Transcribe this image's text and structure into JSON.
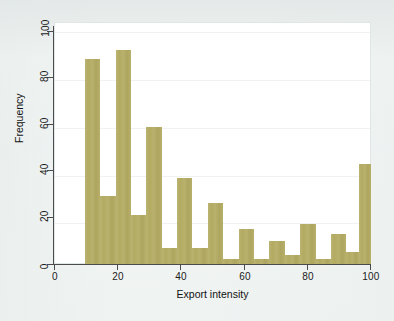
{
  "chart_data": {
    "type": "bar",
    "subtype": "histogram",
    "title": "",
    "xlabel": "Export intensity",
    "ylabel": "Frequency",
    "xlim": [
      0,
      100
    ],
    "ylim": [
      0,
      100
    ],
    "grid": true,
    "legend": null,
    "bar_color": "#b3ab62",
    "plot_background": "#ffffff",
    "page_background": "#edf1f0",
    "bin_width": 5,
    "xticks": [
      0,
      20,
      40,
      60,
      80,
      100
    ],
    "xtick_labels": [
      "0",
      "20",
      "40",
      "60",
      "80",
      "100"
    ],
    "yticks": [
      0,
      20,
      40,
      60,
      80,
      100
    ],
    "ytick_labels": [
      "0",
      "20",
      "40",
      "60",
      "80",
      "100"
    ],
    "bin_starts": [
      10,
      15,
      20,
      25,
      30,
      35,
      40,
      45,
      50,
      55,
      60,
      65,
      70,
      75,
      80,
      85,
      90,
      95
    ],
    "categories": [
      "10-15",
      "15-20",
      "20-25",
      "25-30",
      "30-35",
      "35-40",
      "40-45",
      "45-50",
      "50-55",
      "55-60",
      "60-65",
      "65-70",
      "70-75",
      "75-80",
      "80-85",
      "85-90",
      "90-95",
      "95-100"
    ],
    "values": [
      88,
      29,
      92,
      21,
      59,
      7,
      37,
      7,
      26,
      2,
      15,
      2,
      10,
      4,
      17,
      2,
      13,
      5
    ],
    "extra_bar": {
      "category": "100",
      "value": 43,
      "note": "tall bar at right edge spanning 95-100"
    }
  },
  "bars": [
    {
      "label": "10-15",
      "x0": 10,
      "x1": 15,
      "value": 88
    },
    {
      "label": "15-20",
      "x0": 15,
      "x1": 20,
      "value": 29
    },
    {
      "label": "20-25",
      "x0": 20,
      "x1": 25,
      "value": 92
    },
    {
      "label": "25-30",
      "x0": 25,
      "x1": 30,
      "value": 21
    },
    {
      "label": "30-35",
      "x0": 30,
      "x1": 35,
      "value": 59
    },
    {
      "label": "35-40",
      "x0": 35,
      "x1": 40,
      "value": 7
    },
    {
      "label": "40-45",
      "x0": 40,
      "x1": 45,
      "value": 37
    },
    {
      "label": "45-50",
      "x0": 45,
      "x1": 50,
      "value": 7
    },
    {
      "label": "50-55",
      "x0": 50,
      "x1": 55,
      "value": 26
    },
    {
      "label": "55-60",
      "x0": 55,
      "x1": 60,
      "value": 2
    },
    {
      "label": "60-65",
      "x0": 60,
      "x1": 65,
      "value": 15
    },
    {
      "label": "65-70",
      "x0": 65,
      "x1": 70,
      "value": 2
    },
    {
      "label": "70-75",
      "x0": 70,
      "x1": 75,
      "value": 10
    },
    {
      "label": "75-80",
      "x0": 75,
      "x1": 80,
      "value": 4
    },
    {
      "label": "80-85",
      "x0": 80,
      "x1": 85,
      "value": 17
    },
    {
      "label": "85-90",
      "x0": 85,
      "x1": 90,
      "value": 2
    },
    {
      "label": "90-95",
      "x0": 90,
      "x1": 95,
      "value": 13
    },
    {
      "label": "95-99",
      "x0": 95,
      "x1": 99,
      "value": 5
    },
    {
      "label": "99-100",
      "x0": 99,
      "x1": 103,
      "value": 43
    }
  ],
  "axes": {
    "x_title": "Export intensity",
    "y_title": "Frequency",
    "x_ticks": [
      "0",
      "20",
      "40",
      "60",
      "80",
      "100"
    ],
    "y_ticks": [
      "0",
      "20",
      "40",
      "60",
      "80",
      "100"
    ]
  }
}
